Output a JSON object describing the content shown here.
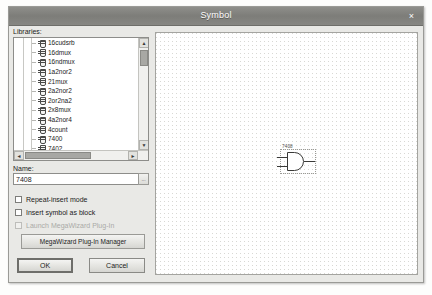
{
  "window": {
    "title": "Symbol",
    "close_label": "×"
  },
  "left_panel": {
    "libraries_label": "Libraries:",
    "tree_items": [
      {
        "label": "16cudsrb",
        "selected": false
      },
      {
        "label": "16dmux",
        "selected": false
      },
      {
        "label": "16ndmux",
        "selected": false
      },
      {
        "label": "1a2nor2",
        "selected": false
      },
      {
        "label": "21mux",
        "selected": false
      },
      {
        "label": "2a2nor2",
        "selected": false
      },
      {
        "label": "2or2na2",
        "selected": false
      },
      {
        "label": "2x8mux",
        "selected": false
      },
      {
        "label": "4a2nor4",
        "selected": false
      },
      {
        "label": "4count",
        "selected": false
      },
      {
        "label": "7400",
        "selected": false
      },
      {
        "label": "7402",
        "selected": false
      },
      {
        "label": "7404",
        "selected": false
      },
      {
        "label": "7408",
        "selected": true
      },
      {
        "label": "7410",
        "selected": false
      }
    ],
    "scroll": {
      "up_arrow": "▲",
      "down_arrow": "▼",
      "left_arrow": "◄",
      "right_arrow": "►"
    },
    "name_label": "Name:",
    "name_value": "7408",
    "name_browse_label": "...",
    "checkboxes": [
      {
        "label": "Repeat-insert mode",
        "checked": false,
        "disabled": false
      },
      {
        "label": "Insert symbol as block",
        "checked": false,
        "disabled": false
      },
      {
        "label": "Launch MegaWizard Plug-In",
        "checked": false,
        "disabled": true
      }
    ],
    "megawizard_button": "MegaWizard Plug-In Manager",
    "ok_button": "OK",
    "cancel_button": "Cancel"
  },
  "canvas": {
    "symbol_label": "7408"
  },
  "colors": {
    "titlebar": "#7d7d79",
    "dialog_face": "#e9e9e6",
    "selection": "#8c8c88",
    "grid_dot": "#d8d8d4",
    "symbol_line": "#3a3a38"
  }
}
